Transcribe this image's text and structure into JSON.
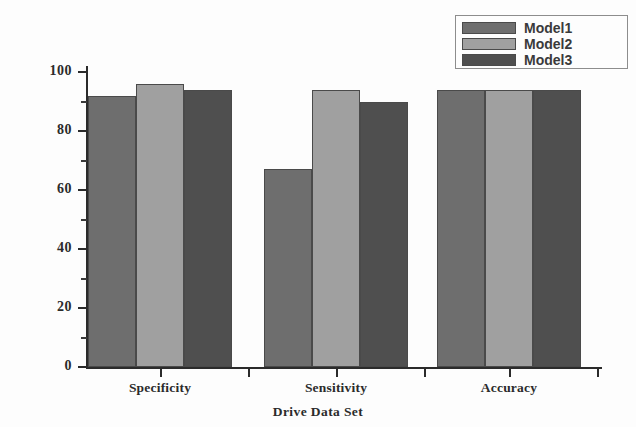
{
  "chart_data": {
    "type": "bar",
    "title": "",
    "xlabel": "Drive Data Set",
    "ylabel": "",
    "categories": [
      "Specificity",
      "Sensitivity",
      "Accuracy"
    ],
    "series": [
      {
        "name": "Model1",
        "color": "#6e6e6e",
        "values": [
          92,
          67,
          94
        ]
      },
      {
        "name": "Model2",
        "color": "#a0a0a0",
        "values": [
          96,
          94,
          94
        ]
      },
      {
        "name": "Model3",
        "color": "#4f4f4f",
        "values": [
          94,
          90,
          94
        ]
      }
    ],
    "ylim": [
      0,
      100
    ],
    "yticks": [
      0,
      20,
      40,
      60,
      80,
      100
    ],
    "ytick_labels": [
      "0",
      "20",
      "40",
      "60",
      "80",
      "100"
    ],
    "yminor_ticks": [
      10,
      30,
      50,
      70,
      90
    ],
    "grid": false,
    "legend_position": "top-right"
  },
  "legend": {
    "items": [
      {
        "label": "Model1",
        "color": "#6e6e6e"
      },
      {
        "label": "Model2",
        "color": "#a0a0a0"
      },
      {
        "label": "Model3",
        "color": "#4f4f4f"
      }
    ]
  },
  "axis": {
    "x_title": "Drive Data Set",
    "y_tick_labels": [
      "100",
      "80",
      "60",
      "40",
      "20",
      "0"
    ],
    "x_categories": [
      "Specificity",
      "Sensitivity",
      "Accuracy"
    ]
  }
}
